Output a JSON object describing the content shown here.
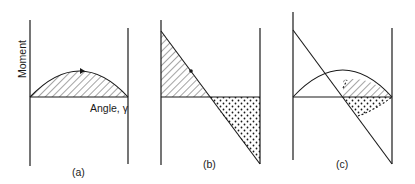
{
  "figure": {
    "y_axis_label": "Moment",
    "x_axis_label": "Angle, γ",
    "panels": [
      {
        "id": "a",
        "caption": "(a)",
        "description": "Parabolic moment curve above baseline with hatched area and arrow"
      },
      {
        "id": "b",
        "caption": "(b)",
        "description": "Linear decreasing moment; hatched triangle above baseline, dotted triangle below"
      },
      {
        "id": "c",
        "caption": "(c)",
        "description": "Overlay of curve and line; hatched region between curve and baseline, dotted region between baseline and line"
      }
    ],
    "fills": {
      "hatched": "positive work area",
      "dotted": "negative work area"
    },
    "colors": {
      "ink": "#1a1a1a",
      "background": "#ffffff"
    }
  }
}
